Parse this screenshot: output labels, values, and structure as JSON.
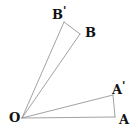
{
  "figure": {
    "kind": "geometry-diagram",
    "canvas": {
      "width": 138,
      "height": 133
    },
    "colors": {
      "background": "#ffffff",
      "stroke": "#8a8a8a",
      "stroke_dark": "#6f6f6f",
      "label": "#111111"
    },
    "stroke_width": 0.8
  },
  "points": {
    "O": {
      "label": "O",
      "prime": "",
      "x": 22,
      "y": 118
    },
    "A": {
      "label": "A",
      "prime": "",
      "x": 115,
      "y": 117
    },
    "Ap": {
      "label": "A",
      "prime": "'",
      "x": 113,
      "y": 95
    },
    "B": {
      "label": "B",
      "prime": "",
      "x": 80,
      "y": 34
    },
    "Bp": {
      "label": "B",
      "prime": "'",
      "x": 64,
      "y": 22
    }
  },
  "segments": [
    {
      "name": "ray-O-to-A",
      "from": "O",
      "to": "A"
    },
    {
      "name": "ray-O-to-A-prime",
      "from": "O",
      "to": "Ap"
    },
    {
      "name": "ray-O-to-B",
      "from": "O",
      "to": "B"
    },
    {
      "name": "ray-O-to-B-prime",
      "from": "O",
      "to": "Bp"
    },
    {
      "name": "segment-A-to-A-prime",
      "from": "A",
      "to": "Ap"
    },
    {
      "name": "segment-B-to-B-prime",
      "from": "B",
      "to": "Bp"
    }
  ],
  "labels": {
    "O": "O",
    "A": "A",
    "Ap": "A",
    "Ap_prime": "'",
    "B": "B",
    "Bp": "B",
    "Bp_prime": "'"
  }
}
